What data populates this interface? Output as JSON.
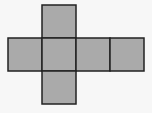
{
  "diagram": {
    "face_fill": "#aaaaaa",
    "stroke": "#222222",
    "background": "#f7f7f7",
    "faces": [
      {
        "name": "top",
        "x": 42,
        "y": 5,
        "w": 34,
        "h": 33
      },
      {
        "name": "left",
        "x": 8,
        "y": 38,
        "w": 34,
        "h": 33
      },
      {
        "name": "center",
        "x": 42,
        "y": 38,
        "w": 34,
        "h": 33
      },
      {
        "name": "right",
        "x": 76,
        "y": 38,
        "w": 34,
        "h": 33
      },
      {
        "name": "far-right",
        "x": 110,
        "y": 38,
        "w": 34,
        "h": 33
      },
      {
        "name": "bottom",
        "x": 42,
        "y": 71,
        "w": 34,
        "h": 33
      }
    ]
  }
}
